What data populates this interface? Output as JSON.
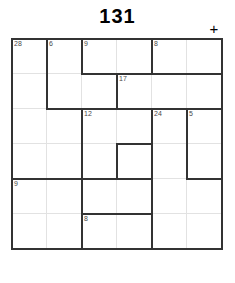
{
  "app": {
    "title": "131",
    "add_icon": "+",
    "add_icon_name": "plus-icon"
  },
  "grid": {
    "columns": 6,
    "rows": 6,
    "cell_size": 35,
    "origin_x": 11,
    "origin_y": 38,
    "width": 211,
    "height": 227,
    "thin_line_color": "#e2e2e2",
    "thick_line_color": "#333333",
    "label_color": "#4a4a4a"
  },
  "clues": [
    {
      "label": "28",
      "col": 0,
      "row": 0
    },
    {
      "label": "6",
      "col": 1,
      "row": 0
    },
    {
      "label": "9",
      "col": 2,
      "row": 0
    },
    {
      "label": "8",
      "col": 4,
      "row": 0
    },
    {
      "label": "17",
      "col": 3,
      "row": 1
    },
    {
      "label": "12",
      "col": 2,
      "row": 2
    },
    {
      "label": "24",
      "col": 4,
      "row": 2
    },
    {
      "label": "5",
      "col": 5,
      "row": 2
    },
    {
      "label": "9",
      "col": 0,
      "row": 4
    },
    {
      "label": "8",
      "col": 2,
      "row": 5
    }
  ],
  "thick_horizontal_segments": [
    {
      "col": 0,
      "row": 0,
      "span": 6
    },
    {
      "col": 2,
      "row": 1,
      "span": 1
    },
    {
      "col": 3,
      "row": 1,
      "span": 3
    },
    {
      "col": 1,
      "row": 2,
      "span": 2
    },
    {
      "col": 3,
      "row": 2,
      "span": 3
    },
    {
      "col": 3,
      "row": 3,
      "span": 1
    },
    {
      "col": 3,
      "row": 4,
      "span": 1
    },
    {
      "col": 0,
      "row": 4,
      "span": 3
    },
    {
      "col": 5,
      "row": 4,
      "span": 1
    },
    {
      "col": 2,
      "row": 5,
      "span": 2
    },
    {
      "col": 0,
      "row": 6,
      "span": 6
    }
  ],
  "thick_vertical_segments": [
    {
      "col": 0,
      "row": 0,
      "span": 6
    },
    {
      "col": 1,
      "row": 0,
      "span": 2
    },
    {
      "col": 2,
      "row": 0,
      "span": 1
    },
    {
      "col": 3,
      "row": 1,
      "span": 1
    },
    {
      "col": 2,
      "row": 2,
      "span": 4
    },
    {
      "col": 4,
      "row": 0,
      "span": 1
    },
    {
      "col": 4,
      "row": 2,
      "span": 1
    },
    {
      "col": 4,
      "row": 3,
      "span": 3
    },
    {
      "col": 5,
      "row": 2,
      "span": 2
    },
    {
      "col": 6,
      "row": 0,
      "span": 6
    },
    {
      "col": 3,
      "row": 3,
      "span": 1
    }
  ]
}
